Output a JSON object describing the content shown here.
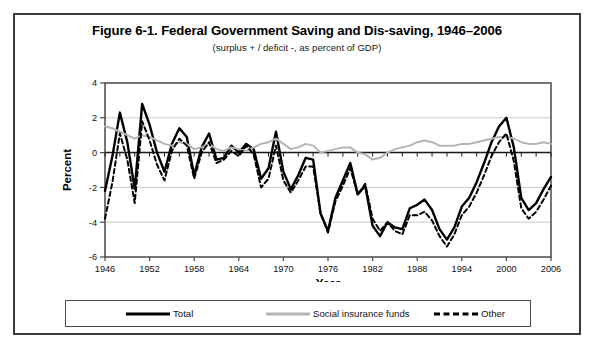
{
  "figure": {
    "title": "Figure 6-1. Federal Government Saving and Dis-saving, 1946–2006",
    "subtitle": "(surplus + / deficit -, as percent of GDP)"
  },
  "axes": {
    "xlabel": "Year",
    "ylabel": "Percent",
    "x_ticks": [
      "1946",
      "1952",
      "1958",
      "1964",
      "1970",
      "1976",
      "1982",
      "1988",
      "1994",
      "2000",
      "2006"
    ],
    "y_ticks": [
      "4",
      "2",
      "0",
      "-2",
      "-4",
      "-6"
    ]
  },
  "legend": {
    "items": [
      {
        "label": "Total",
        "style": "solid",
        "color": "#000000"
      },
      {
        "label": "Social insurance funds",
        "style": "solid-gray",
        "color": "#b4b4b4"
      },
      {
        "label": "Other",
        "style": "dashed",
        "color": "#000000"
      }
    ]
  },
  "chart_data": {
    "type": "line",
    "title": "Figure 6-1. Federal Government Saving and Dis-saving, 1946–2006",
    "subtitle": "(surplus + / deficit -, as percent of GDP)",
    "xlabel": "Year",
    "ylabel": "Percent",
    "xlim": [
      1946,
      2006
    ],
    "ylim": [
      -6,
      4
    ],
    "ytick_step": 2,
    "xtick_step": 6,
    "grid": "horizontal",
    "legend_position": "bottom",
    "x": [
      1946,
      1947,
      1948,
      1949,
      1950,
      1951,
      1952,
      1953,
      1954,
      1955,
      1956,
      1957,
      1958,
      1959,
      1960,
      1961,
      1962,
      1963,
      1964,
      1965,
      1966,
      1967,
      1968,
      1969,
      1970,
      1971,
      1972,
      1973,
      1974,
      1975,
      1976,
      1977,
      1978,
      1979,
      1980,
      1981,
      1982,
      1983,
      1984,
      1985,
      1986,
      1987,
      1988,
      1989,
      1990,
      1991,
      1992,
      1993,
      1994,
      1995,
      1996,
      1997,
      1998,
      1999,
      2000,
      2001,
      2002,
      2003,
      2004,
      2005,
      2006
    ],
    "series": [
      {
        "name": "Total",
        "color": "#000000",
        "style": "solid",
        "values": [
          -2.2,
          -0.2,
          2.3,
          0.6,
          -2.1,
          2.8,
          1.6,
          0.0,
          -1.1,
          0.5,
          1.4,
          0.9,
          -1.3,
          0.3,
          1.1,
          -0.4,
          -0.3,
          0.4,
          0.0,
          0.5,
          0.2,
          -1.5,
          -0.9,
          1.2,
          -1.1,
          -2.1,
          -1.3,
          -0.3,
          -0.4,
          -3.5,
          -4.5,
          -2.6,
          -1.6,
          -0.6,
          -2.4,
          -1.9,
          -4.2,
          -4.8,
          -4.0,
          -4.3,
          -4.4,
          -3.2,
          -3.0,
          -2.7,
          -3.3,
          -4.4,
          -5.0,
          -4.3,
          -3.1,
          -2.6,
          -1.7,
          -0.6,
          0.6,
          1.5,
          2.0,
          0.3,
          -2.6,
          -3.3,
          -2.9,
          -2.1,
          -1.4
        ]
      },
      {
        "name": "Social insurance funds",
        "color": "#b4b4b4",
        "style": "solid",
        "values": [
          1.5,
          1.4,
          1.2,
          1.0,
          0.8,
          1.0,
          0.9,
          0.7,
          0.5,
          0.4,
          0.6,
          0.5,
          0.2,
          0.3,
          0.5,
          0.2,
          0.1,
          0.3,
          0.2,
          0.1,
          0.3,
          0.5,
          0.6,
          0.8,
          0.5,
          0.2,
          0.3,
          0.5,
          0.4,
          0.0,
          0.1,
          0.2,
          0.3,
          0.3,
          0.0,
          -0.1,
          -0.4,
          -0.3,
          0.0,
          0.2,
          0.3,
          0.4,
          0.6,
          0.7,
          0.6,
          0.4,
          0.4,
          0.4,
          0.5,
          0.5,
          0.6,
          0.7,
          0.8,
          0.9,
          0.9,
          0.8,
          0.6,
          0.5,
          0.5,
          0.6,
          0.5
        ]
      },
      {
        "name": "Other",
        "color": "#000000",
        "style": "dashed",
        "values": [
          -3.8,
          -1.7,
          1.1,
          -0.4,
          -2.9,
          1.8,
          0.7,
          -0.7,
          -1.6,
          0.1,
          0.8,
          0.4,
          -1.5,
          0.0,
          0.6,
          -0.6,
          -0.4,
          0.1,
          -0.2,
          0.4,
          -0.1,
          -2.0,
          -1.5,
          0.4,
          -1.6,
          -2.3,
          -1.6,
          -0.8,
          -0.8,
          -3.5,
          -4.6,
          -2.8,
          -1.9,
          -0.9,
          -2.4,
          -1.8,
          -3.8,
          -4.5,
          -4.0,
          -4.5,
          -4.7,
          -3.6,
          -3.6,
          -3.4,
          -3.9,
          -4.8,
          -5.4,
          -4.7,
          -3.6,
          -3.1,
          -2.3,
          -1.3,
          -0.2,
          0.6,
          1.1,
          -0.5,
          -3.2,
          -3.8,
          -3.4,
          -2.7,
          -1.9
        ]
      }
    ]
  }
}
